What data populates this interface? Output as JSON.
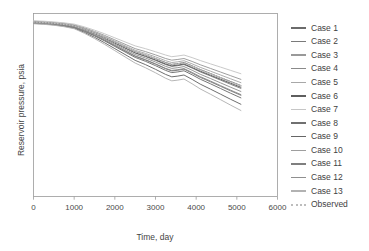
{
  "chart_data": {
    "type": "line",
    "title": "",
    "xlabel": "Time, day",
    "ylabel": "Reservoir pressure, psia",
    "xlim": [
      0,
      6000
    ],
    "ylim": [
      0,
      100
    ],
    "xticks": [
      "0",
      "1000",
      "2000",
      "3000",
      "4000",
      "5000",
      "6000"
    ],
    "xtick_values": [
      0,
      1000,
      2000,
      3000,
      4000,
      5000,
      6000
    ],
    "yticks": [],
    "grid": false,
    "legend_position": "right",
    "x": [
      0,
      250,
      500,
      750,
      1000,
      1250,
      1500,
      1750,
      2000,
      2250,
      2500,
      2750,
      3000,
      3250,
      3400,
      3550,
      3700,
      3900,
      4100,
      4350,
      4600,
      4850,
      5100
    ],
    "series": [
      {
        "name": "Case 1",
        "color": "#6b6b6b",
        "values": [
          95.5,
          95.2,
          94.8,
          94.2,
          93.4,
          91.6,
          89.4,
          87.0,
          84.4,
          81.8,
          79.2,
          77.4,
          75.4,
          73.2,
          72.2,
          72.6,
          73.2,
          71.4,
          69.4,
          67.2,
          65.0,
          62.8,
          60.6
        ]
      },
      {
        "name": "Case 2",
        "color": "#7a7a7a",
        "values": [
          95.2,
          94.9,
          94.5,
          93.9,
          93.1,
          91.2,
          89.0,
          86.5,
          83.8,
          81.1,
          78.4,
          76.5,
          74.4,
          72.1,
          71.1,
          71.5,
          72.1,
          70.2,
          68.1,
          65.9,
          63.6,
          61.3,
          59.1
        ]
      },
      {
        "name": "Case 3",
        "color": "#999999",
        "values": [
          95.8,
          95.5,
          95.1,
          94.6,
          93.8,
          92.2,
          90.2,
          88.0,
          85.6,
          83.2,
          80.8,
          79.2,
          77.4,
          75.4,
          74.5,
          74.9,
          75.4,
          73.8,
          72.0,
          70.0,
          68.0,
          66.0,
          64.0
        ]
      },
      {
        "name": "Case 4",
        "color": "#8a8a8a",
        "values": [
          95.0,
          94.7,
          94.3,
          93.6,
          92.7,
          90.6,
          88.2,
          85.5,
          82.6,
          79.7,
          76.8,
          74.8,
          72.5,
          70.0,
          68.9,
          69.3,
          69.9,
          67.8,
          65.5,
          63.1,
          60.6,
          58.1,
          55.7
        ]
      },
      {
        "name": "Case 5",
        "color": "#a8a8a8",
        "values": [
          95.6,
          95.3,
          94.9,
          94.3,
          93.5,
          91.8,
          89.7,
          87.4,
          84.9,
          82.4,
          79.9,
          78.2,
          76.3,
          74.2,
          73.2,
          73.6,
          74.2,
          72.5,
          70.6,
          68.5,
          66.4,
          64.3,
          62.2
        ]
      },
      {
        "name": "Case 6",
        "color": "#5e5e5e",
        "values": [
          95.3,
          95.0,
          94.6,
          94.0,
          93.2,
          91.4,
          89.2,
          86.7,
          84.0,
          81.3,
          78.6,
          76.8,
          74.7,
          72.4,
          71.4,
          71.8,
          72.4,
          70.5,
          68.5,
          66.3,
          64.1,
          61.9,
          59.7
        ]
      },
      {
        "name": "Case 7",
        "color": "#c6c6c6",
        "values": [
          96.0,
          95.8,
          95.4,
          94.9,
          94.2,
          92.7,
          90.9,
          88.9,
          86.7,
          84.5,
          82.3,
          80.8,
          79.1,
          77.3,
          76.4,
          76.8,
          77.3,
          75.9,
          74.3,
          72.5,
          70.7,
          68.9,
          67.1
        ]
      },
      {
        "name": "Case 8",
        "color": "#707070",
        "values": [
          94.8,
          94.5,
          94.1,
          93.4,
          92.4,
          90.3,
          87.8,
          85.0,
          82.0,
          79.0,
          76.0,
          73.9,
          71.5,
          68.9,
          67.7,
          68.1,
          68.7,
          66.5,
          64.1,
          61.6,
          59.0,
          56.4,
          53.9
        ]
      },
      {
        "name": "Case 9",
        "color": "#666666",
        "values": [
          94.6,
          94.3,
          93.8,
          93.1,
          92.0,
          89.7,
          87.0,
          84.0,
          80.8,
          77.6,
          74.4,
          72.1,
          69.5,
          66.7,
          65.4,
          65.8,
          66.4,
          64.0,
          61.4,
          58.7,
          55.9,
          53.1,
          50.4
        ]
      },
      {
        "name": "Case 10",
        "color": "#9e9e9e",
        "values": [
          95.4,
          95.1,
          94.7,
          94.1,
          93.3,
          91.5,
          89.3,
          86.9,
          84.3,
          81.7,
          79.1,
          77.3,
          75.3,
          73.1,
          72.1,
          72.5,
          73.1,
          71.3,
          69.3,
          67.1,
          64.9,
          62.7,
          60.5
        ]
      },
      {
        "name": "Case 11",
        "color": "#7f7f7f",
        "values": [
          94.9,
          94.6,
          94.2,
          93.5,
          92.5,
          90.4,
          88.0,
          85.3,
          82.4,
          79.5,
          76.6,
          74.6,
          72.3,
          69.8,
          68.6,
          69.0,
          69.6,
          67.4,
          65.1,
          62.7,
          60.2,
          57.7,
          55.3
        ]
      },
      {
        "name": "Case 12",
        "color": "#8f8f8f",
        "values": [
          95.1,
          94.8,
          94.4,
          93.8,
          92.9,
          90.9,
          88.6,
          86.0,
          83.2,
          80.4,
          77.6,
          75.7,
          73.5,
          71.1,
          70.0,
          70.4,
          71.0,
          69.0,
          66.8,
          64.5,
          62.1,
          59.7,
          57.4
        ]
      },
      {
        "name": "Case 13",
        "color": "#b2b2b2",
        "values": [
          94.4,
          94.1,
          93.6,
          92.8,
          91.7,
          89.2,
          86.3,
          83.1,
          79.7,
          76.3,
          72.9,
          70.4,
          67.6,
          64.6,
          63.2,
          63.6,
          64.2,
          61.6,
          58.8,
          55.9,
          52.9,
          49.9,
          47.0
        ]
      },
      {
        "name": "Observed",
        "color": "#bdbdbd",
        "style": "dotted",
        "values": [
          95.4,
          95.1,
          94.7,
          94.1,
          93.3,
          91.5,
          89.3,
          86.9,
          84.3,
          81.7,
          79.1,
          77.3,
          75.3,
          73.1,
          72.1,
          72.5,
          73.1,
          71.3,
          69.3,
          67.1,
          64.9,
          62.7,
          60.5
        ]
      }
    ]
  },
  "legend": {
    "items": [
      {
        "label": "Case 1"
      },
      {
        "label": "Case 2"
      },
      {
        "label": "Case 3"
      },
      {
        "label": "Case 4"
      },
      {
        "label": "Case 5"
      },
      {
        "label": "Case 6"
      },
      {
        "label": "Case 7"
      },
      {
        "label": "Case 8"
      },
      {
        "label": "Case 9"
      },
      {
        "label": "Case 10"
      },
      {
        "label": "Case 11"
      },
      {
        "label": "Case 12"
      },
      {
        "label": "Case 13"
      },
      {
        "label": "Observed"
      }
    ]
  },
  "axes": {
    "x_title": "Time, day",
    "y_title": "Reservoir pressure, psia",
    "x_tick_labels": [
      "0",
      "1000",
      "2000",
      "3000",
      "4000",
      "5000",
      "6000"
    ]
  },
  "colors": {
    "frame": "#9a9a9a",
    "text": "#3f3f3f",
    "background": "#ffffff"
  }
}
